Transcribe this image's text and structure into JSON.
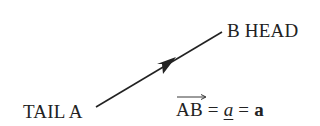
{
  "diagram": {
    "type": "vector",
    "tail_label": "TAIL A",
    "head_label": "B HEAD",
    "equation": {
      "vector_name": "AB",
      "eq1": " = ",
      "underline_symbol": "a",
      "eq2": " = ",
      "bold_symbol": "a"
    },
    "line_color": "#222222",
    "tail_point": [
      96,
      107
    ],
    "head_point": [
      222,
      32
    ]
  }
}
